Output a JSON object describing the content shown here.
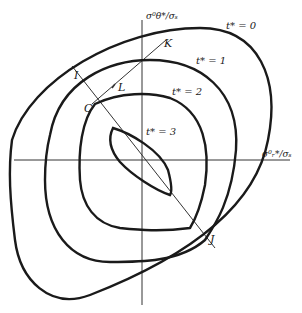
{
  "diagram": {
    "axes": {
      "x_label": "σ⁰ᵣ*/σₛ",
      "y_label": "σ⁰θ*/σₛ"
    },
    "curves": [
      {
        "label": "t* = 0"
      },
      {
        "label": "t* = 1"
      },
      {
        "label": "t* = 2"
      },
      {
        "label": "t* = 3"
      }
    ],
    "points": {
      "I": "I",
      "J": "J",
      "K": "K",
      "L": "L",
      "C": "C"
    },
    "colors": {
      "ink": "#1a1a1a",
      "background": "#ffffff"
    }
  }
}
